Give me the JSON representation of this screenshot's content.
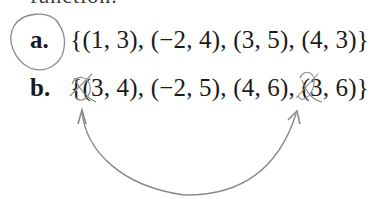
{
  "page": {
    "clipped_top_text": "function.",
    "problems": [
      {
        "label": "a.",
        "set": "{(1, 3), (−2, 4), (3, 5), (4, 3)}"
      },
      {
        "label": "b.",
        "set": "{(3, 4), (−2, 5), (4, 6), (3, 6)}"
      }
    ]
  },
  "annotations": {
    "pencil_color": "#8a8a8a",
    "circle_around": "a.",
    "crossed_out_elements": [
      "3 in (3, 4)",
      "3 in (3, 6)"
    ],
    "arrow": "curved double-headed arrow linking the two repeated x-values 3 in set b"
  }
}
